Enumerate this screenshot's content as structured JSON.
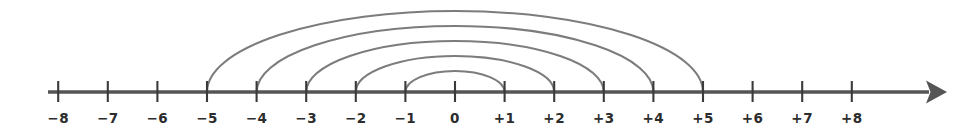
{
  "figure": {
    "type": "number-line-diagram",
    "title": "",
    "colors": {
      "background": "#ffffff",
      "axis": "#555555",
      "tick": "#3a3a3a",
      "label": "#2c2c2c",
      "arc": "#7c7c7c"
    }
  },
  "axis": {
    "name": "number-line",
    "min": -8,
    "max": 8,
    "step": 1,
    "arrow": "right",
    "baseline_y": 92,
    "left_x": 48,
    "right_x": 947,
    "unit_px": 49.6,
    "zero_x": 455,
    "tick_top": 81,
    "tick_bottom": 102,
    "label_y": 123,
    "ticks": [
      {
        "value": -8,
        "label": "−8",
        "x": 58.2
      },
      {
        "value": -7,
        "label": "−7",
        "x": 107.8
      },
      {
        "value": -6,
        "label": "−6",
        "x": 157.4
      },
      {
        "value": -5,
        "label": "−5",
        "x": 207.0
      },
      {
        "value": -4,
        "label": "−4",
        "x": 256.6
      },
      {
        "value": -3,
        "label": "−3",
        "x": 306.2
      },
      {
        "value": -2,
        "label": "−2",
        "x": 355.8
      },
      {
        "value": -1,
        "label": "−1",
        "x": 405.4
      },
      {
        "value": 0,
        "label": "0",
        "x": 455.0
      },
      {
        "value": 1,
        "label": "+1",
        "x": 504.6
      },
      {
        "value": 2,
        "label": "+2",
        "x": 554.2
      },
      {
        "value": 3,
        "label": "+3",
        "x": 603.8
      },
      {
        "value": 4,
        "label": "+4",
        "x": 653.4
      },
      {
        "value": 5,
        "label": "+5",
        "x": 703.0
      },
      {
        "value": 6,
        "label": "+6",
        "x": 752.6
      },
      {
        "value": 7,
        "label": "+7",
        "x": 802.2
      },
      {
        "value": 8,
        "label": "+8",
        "x": 851.8
      }
    ]
  },
  "arcs": [
    {
      "id": "arc-5",
      "from": -5,
      "to": 5,
      "from_x": 207.0,
      "to_x": 703.0,
      "apex_y": 11,
      "pair": "−5 ↔ +5"
    },
    {
      "id": "arc-4",
      "from": -4,
      "to": 4,
      "from_x": 256.6,
      "to_x": 653.4,
      "apex_y": 26,
      "pair": "−4 ↔ +4"
    },
    {
      "id": "arc-3",
      "from": -3,
      "to": 3,
      "from_x": 306.2,
      "to_x": 603.8,
      "apex_y": 41,
      "pair": "−3 ↔ +3"
    },
    {
      "id": "arc-2",
      "from": -2,
      "to": 2,
      "from_x": 355.8,
      "to_x": 554.2,
      "apex_y": 56,
      "pair": "−2 ↔ +2"
    },
    {
      "id": "arc-1",
      "from": -1,
      "to": 1,
      "from_x": 405.4,
      "to_x": 504.6,
      "apex_y": 71,
      "pair": "−1 ↔ +1"
    }
  ]
}
